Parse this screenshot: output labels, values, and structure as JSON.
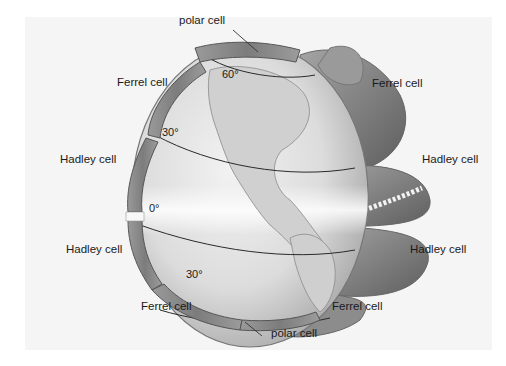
{
  "figure": {
    "background_color": "#f5f5f5",
    "globe_color": "#e6e6e6",
    "cell_color": "#8a8a8a",
    "line_color": "#2a2a2a"
  },
  "labels": {
    "polar_top": "polar cell",
    "ferrel_upper_left": "Ferrel cell",
    "ferrel_upper_right": "Ferrel cell",
    "hadley_upper_left": "Hadley cell",
    "hadley_upper_right": "Hadley cell",
    "hadley_lower_left": "Hadley cell",
    "hadley_lower_right": "Hadley cell",
    "ferrel_lower_left": "Ferrel cell",
    "ferrel_lower_right": "Ferrel cell",
    "polar_bottom": "polar cell"
  },
  "latitudes": {
    "north_60": "60°",
    "north_30": "30°",
    "equator": "0°",
    "south_30": "30°"
  }
}
